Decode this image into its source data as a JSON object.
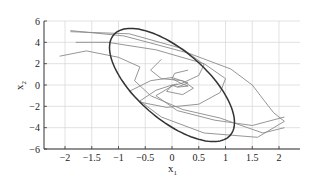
{
  "chart_data": {
    "type": "line",
    "title": "",
    "xlabel": "x1",
    "ylabel": "x2",
    "xlabel_main": "x",
    "xlabel_sub": "1",
    "ylabel_main": "x",
    "ylabel_sub": "2",
    "xlim": [
      -2.4,
      2.4
    ],
    "ylim": [
      -6,
      6
    ],
    "grid": true,
    "legend": null,
    "xticks": [
      -2,
      -1.5,
      -1,
      -0.5,
      0,
      0.5,
      1,
      1.5,
      2
    ],
    "xtick_labels": [
      "−2",
      "−1.5",
      "−1",
      "−0.5",
      "0",
      "0.5",
      "1",
      "1.5",
      "2"
    ],
    "yticks": [
      6,
      4,
      2,
      0,
      -2,
      -4,
      -6
    ],
    "ytick_labels": [
      "6",
      "4",
      "2",
      "0",
      "−2",
      "−4",
      "−6"
    ],
    "ellipse": {
      "description": "Invariant ellipse boundary (dark)",
      "color": "#333333",
      "center": [
        0,
        0
      ],
      "points": [
        [
          -2.2,
          4.0
        ],
        [
          -2.1,
          4.8
        ],
        [
          -1.8,
          5.2
        ],
        [
          -1.2,
          5.2
        ],
        [
          -0.5,
          4.7
        ],
        [
          0.3,
          3.9
        ],
        [
          1.0,
          2.6
        ],
        [
          1.6,
          1.2
        ],
        [
          2.0,
          -0.5
        ],
        [
          2.2,
          -2.2
        ],
        [
          2.25,
          -3.6
        ],
        [
          2.0,
          -4.9
        ],
        [
          1.5,
          -5.3
        ],
        [
          0.9,
          -5.2
        ],
        [
          0.2,
          -4.6
        ],
        [
          -0.6,
          -3.7
        ],
        [
          -1.3,
          -2.4
        ],
        [
          -1.8,
          -0.8
        ],
        [
          -2.1,
          1.0
        ],
        [
          -2.25,
          2.6
        ],
        [
          -2.2,
          4.0
        ]
      ]
    },
    "series": [
      {
        "name": "trajectory-1",
        "color": "#8a8a8a",
        "points": [
          [
            -1.9,
            5.0
          ],
          [
            -0.8,
            4.8
          ],
          [
            0.2,
            3.4
          ],
          [
            0.6,
            1.9
          ],
          [
            0.5,
            0.9
          ],
          [
            0.2,
            0.2
          ],
          [
            0.0,
            -0.1
          ],
          [
            -0.3,
            -1.0
          ],
          [
            0.1,
            -2.4
          ],
          [
            0.8,
            -3.3
          ],
          [
            1.5,
            -3.8
          ],
          [
            2.1,
            -3.0
          ]
        ]
      },
      {
        "name": "trajectory-2",
        "color": "#8a8a8a",
        "points": [
          [
            -1.8,
            4.0
          ],
          [
            -1.2,
            4.0
          ],
          [
            -0.3,
            3.3
          ],
          [
            0.6,
            2.0
          ],
          [
            1.0,
            0.6
          ],
          [
            0.9,
            -0.7
          ],
          [
            0.5,
            -1.8
          ],
          [
            -0.1,
            -2.1
          ],
          [
            -0.6,
            -1.6
          ],
          [
            -0.8,
            -0.6
          ],
          [
            -0.4,
            0.4
          ],
          [
            0.0,
            0.7
          ],
          [
            0.3,
            0.2
          ],
          [
            0.1,
            -0.2
          ]
        ]
      },
      {
        "name": "trajectory-3",
        "color": "#8a8a8a",
        "points": [
          [
            -2.1,
            2.7
          ],
          [
            -1.6,
            3.2
          ],
          [
            -1.0,
            2.6
          ],
          [
            -0.6,
            1.7
          ],
          [
            -0.7,
            0.4
          ],
          [
            -0.4,
            -1.0
          ],
          [
            0.2,
            -2.3
          ],
          [
            0.9,
            -3.1
          ],
          [
            1.7,
            -4.5
          ],
          [
            2.1,
            -4.0
          ]
        ]
      },
      {
        "name": "trajectory-4",
        "color": "#8a8a8a",
        "points": [
          [
            -0.2,
            2.4
          ],
          [
            -0.4,
            1.4
          ],
          [
            -0.2,
            0.6
          ],
          [
            0.2,
            0.4
          ],
          [
            0.4,
            -0.3
          ],
          [
            0.2,
            -0.9
          ],
          [
            -0.1,
            -0.6
          ],
          [
            0.0,
            0.0
          ],
          [
            0.1,
            0.1
          ]
        ]
      },
      {
        "name": "trajectory-5",
        "color": "#8a8a8a",
        "points": [
          [
            0.3,
            1.4
          ],
          [
            0.05,
            1.1
          ],
          [
            0.0,
            0.6
          ],
          [
            0.15,
            0.2
          ],
          [
            0.3,
            -0.1
          ],
          [
            0.1,
            -0.2
          ],
          [
            0.0,
            0.0
          ]
        ]
      },
      {
        "name": "trajectory-6",
        "color": "#8a8a8a",
        "points": [
          [
            -1.9,
            5.1
          ],
          [
            -0.9,
            4.6
          ],
          [
            0.3,
            3.0
          ],
          [
            1.1,
            1.5
          ],
          [
            1.5,
            0.0
          ],
          [
            1.7,
            -1.3
          ],
          [
            1.9,
            -2.6
          ],
          [
            2.1,
            -3.4
          ],
          [
            1.6,
            -4.9
          ],
          [
            0.6,
            -4.5
          ],
          [
            -0.2,
            -3.0
          ],
          [
            -0.6,
            -1.5
          ],
          [
            -0.3,
            -0.5
          ],
          [
            0.0,
            0.0
          ]
        ]
      }
    ]
  }
}
